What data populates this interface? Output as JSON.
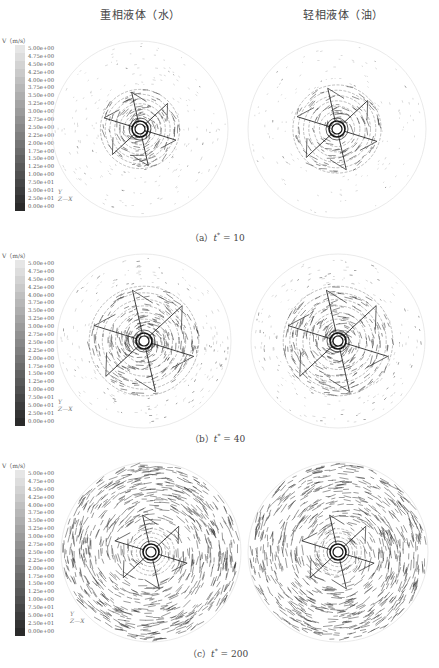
{
  "figure": {
    "column_titles": {
      "left": "重相液体（水）",
      "right": "轻相液体（油）"
    },
    "legend": {
      "title": "V（m/s）",
      "labels": [
        "5.00e+00",
        "4.75e+00",
        "4.50e+00",
        "4.25e+00",
        "4.00e+00",
        "3.75e+00",
        "3.50e+00",
        "3.25e+00",
        "3.00e+00",
        "2.75e+00",
        "2.50e+00",
        "2.25e+00",
        "2.00e+00",
        "1.75e+00",
        "1.50e+00",
        "1.25e+00",
        "1.00e+00",
        "7.50e+01",
        "5.00e+01",
        "2.50e+01",
        "0.00e+00"
      ],
      "gradient": {
        "top": "#e6e6e6",
        "bottom": "#2a2a2a"
      }
    },
    "axis_triad": {
      "y": "Y",
      "z": "Z",
      "x": "X"
    },
    "panels": [
      {
        "id": "a",
        "caption_prefix": "（a）",
        "caption_var": "t",
        "caption_sup": "*",
        "caption_value": "= 10",
        "left_label": "重相液体（水）",
        "right_label": "轻相液体（油）"
      },
      {
        "id": "b",
        "caption_prefix": "（b）",
        "caption_var": "t",
        "caption_sup": "*",
        "caption_value": "= 40",
        "left_label": "重相液体（水）",
        "right_label": "轻相液体（油）"
      },
      {
        "id": "c",
        "caption_prefix": "（c）",
        "caption_var": "t",
        "caption_sup": "*",
        "caption_value": "= 200",
        "left_label": "重相液体（水）",
        "right_label": "轻相液体（油）"
      }
    ],
    "colors": {
      "vector_dark": "#2b2b2b",
      "vector_light": "#9a9a9a",
      "boundary": "#e4e4e4"
    }
  }
}
